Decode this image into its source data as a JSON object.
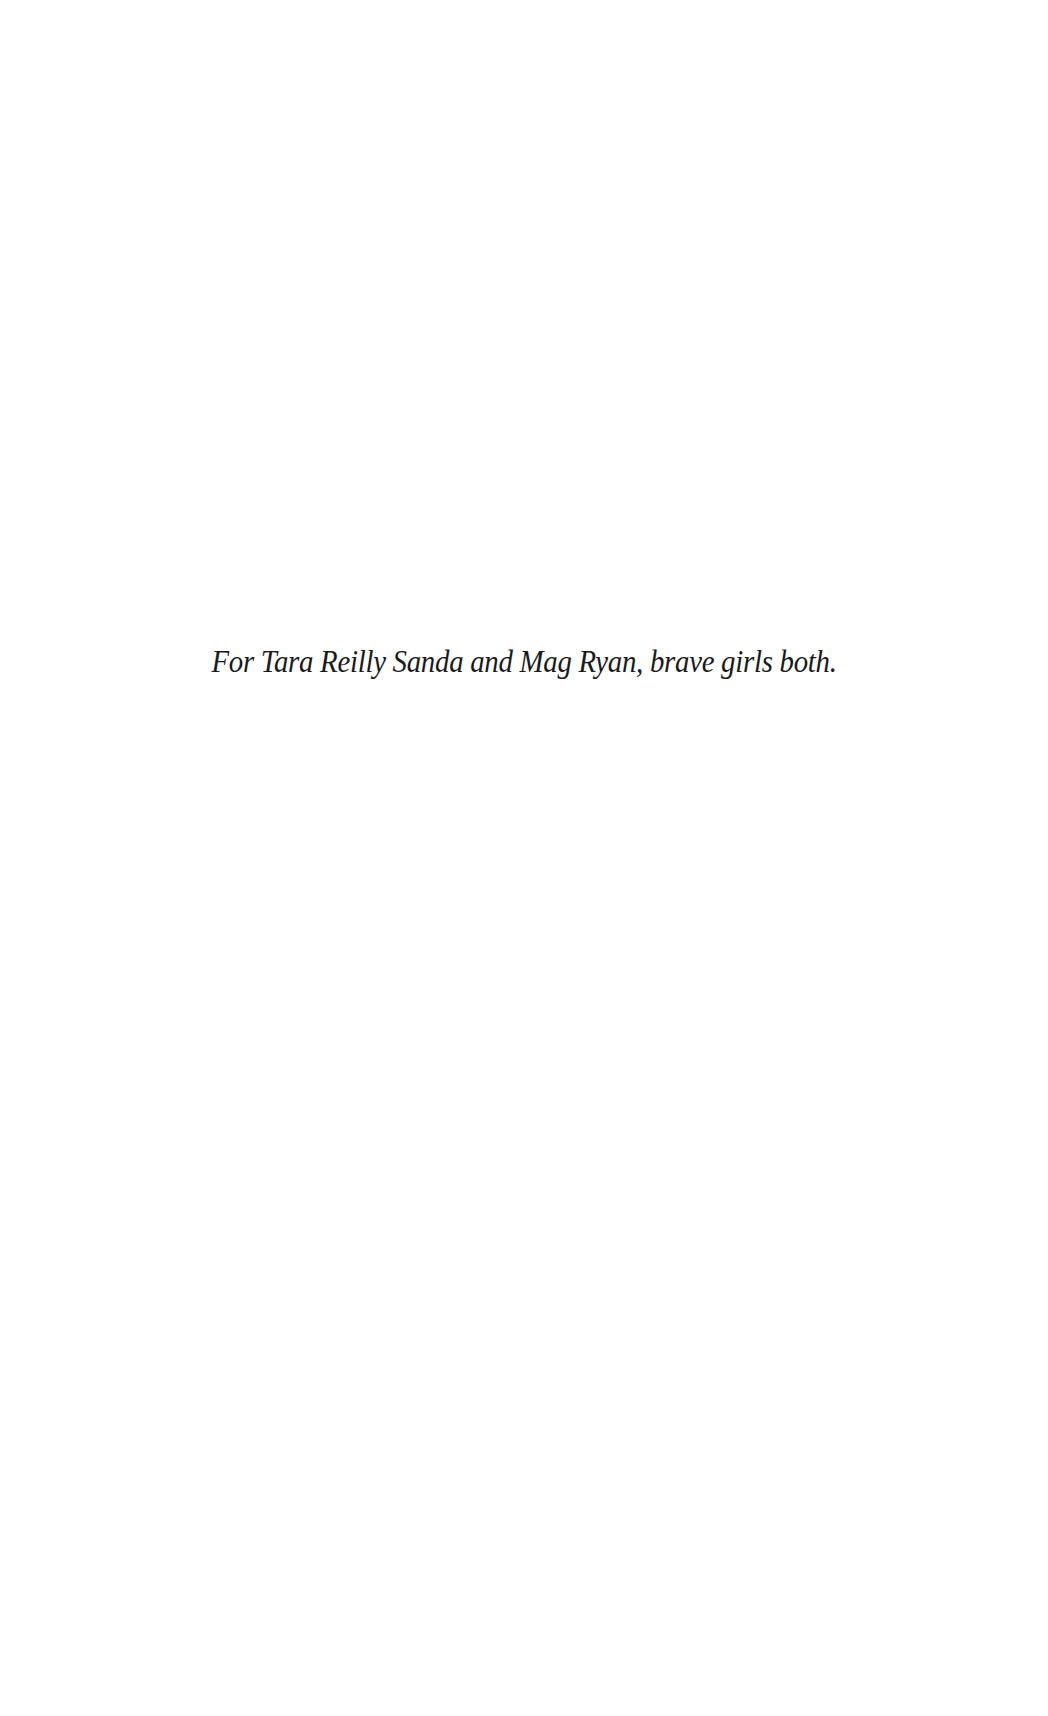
{
  "page": {
    "type": "dedication",
    "text": "For Tara Reilly Sanda and Mag Ryan, brave girls both."
  }
}
